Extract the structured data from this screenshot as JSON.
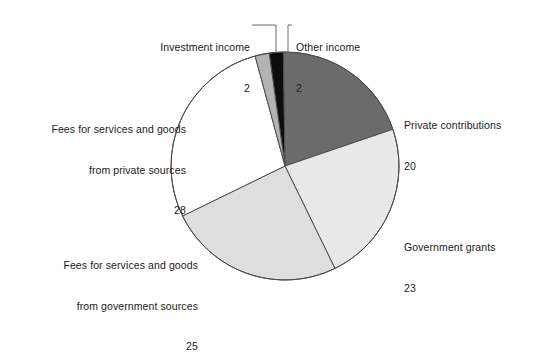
{
  "chart_data": {
    "type": "pie",
    "title": "",
    "subtitle": "",
    "units": "percent",
    "total": 100,
    "legend_position": "outside-labels",
    "grid": false,
    "start_angle_deg": -8,
    "direction": "clockwise",
    "categories": [
      "Other income",
      "Private contributions",
      "Government grants",
      "Fees for services and goods from government sources",
      "Fees for services and goods from private sources",
      "Investment income"
    ],
    "values": [
      2,
      20,
      23,
      25,
      28,
      2
    ],
    "colors": [
      "#0d0d0d",
      "#6b6b6b",
      "#e8e8e8",
      "#dedede",
      "#ffffff",
      "#b3b3b3"
    ],
    "slices": [
      {
        "id": "other-income",
        "label": "Other income",
        "value": 2,
        "value_text": "2",
        "color": "#0d0d0d",
        "has_leader_line": true
      },
      {
        "id": "private-contributions",
        "label": "Private contributions",
        "value": 20,
        "value_text": "20",
        "color": "#6b6b6b",
        "has_leader_line": false
      },
      {
        "id": "government-grants",
        "label": "Government grants",
        "value": 23,
        "value_text": "23",
        "color": "#e8e8e8",
        "has_leader_line": false
      },
      {
        "id": "fees-government-sources",
        "label_line1": "Fees for services and goods",
        "label_line2": "from government sources",
        "value": 25,
        "value_text": "25",
        "color": "#dedede",
        "has_leader_line": false
      },
      {
        "id": "fees-private-sources",
        "label_line1": "Fees for services and goods",
        "label_line2": "from private sources",
        "value": 28,
        "value_text": "28",
        "color": "#ffffff",
        "has_leader_line": false
      },
      {
        "id": "investment-income",
        "label": "Investment income",
        "value": 2,
        "value_text": "2",
        "color": "#b3b3b3",
        "has_leader_line": true
      }
    ]
  },
  "labels": {
    "investment_income": {
      "name": "Investment income",
      "value": "2"
    },
    "other_income": {
      "name": "Other income",
      "value": "2"
    },
    "private_contributions": {
      "name": "Private contributions",
      "value": "20"
    },
    "government_grants": {
      "name": "Government grants",
      "value": "23"
    },
    "fees_private": {
      "line1": "Fees for services and goods",
      "line2": "from private sources",
      "value": "28"
    },
    "fees_government": {
      "line1": "Fees for services and goods",
      "line2": "from government sources",
      "value": "25"
    }
  },
  "style": {
    "outline_color": "#4d4d4d",
    "leader_line_color": "#6a6a6a",
    "background": "#ffffff"
  }
}
